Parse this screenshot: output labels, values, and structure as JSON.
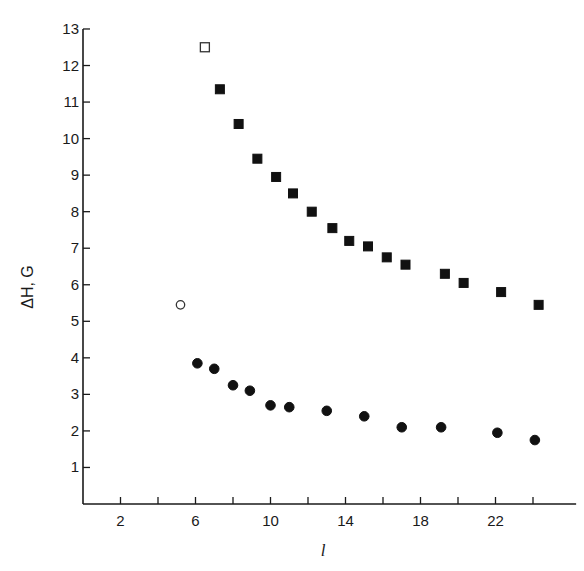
{
  "chart_data": {
    "type": "scatter",
    "title": "",
    "xlabel": "l",
    "ylabel": "ΔH, G",
    "xlim": [
      0,
      26
    ],
    "ylim": [
      0,
      13
    ],
    "grid": false,
    "legend": "none",
    "x_ticks": [
      2,
      4,
      6,
      8,
      10,
      12,
      14,
      16,
      18,
      20,
      22,
      24
    ],
    "x_tick_labels": [
      {
        "value": 2,
        "label": "2"
      },
      {
        "value": 6,
        "label": "6"
      },
      {
        "value": 10,
        "label": "10"
      },
      {
        "value": 14,
        "label": "14"
      },
      {
        "value": 18,
        "label": "18"
      },
      {
        "value": 22,
        "label": "22"
      }
    ],
    "y_ticks": [
      1,
      2,
      3,
      4,
      5,
      6,
      7,
      8,
      9,
      10,
      11,
      12,
      13
    ],
    "y_tick_labels": [
      "1",
      "2",
      "3",
      "4",
      "5",
      "6",
      "7",
      "8",
      "9",
      "10",
      "11",
      "12",
      "13"
    ],
    "series": [
      {
        "name": "squares-filled",
        "marker": "square",
        "filled": true,
        "points": [
          {
            "x": 7.3,
            "y": 11.35
          },
          {
            "x": 8.3,
            "y": 10.4
          },
          {
            "x": 9.3,
            "y": 9.45
          },
          {
            "x": 10.3,
            "y": 8.95
          },
          {
            "x": 11.2,
            "y": 8.5
          },
          {
            "x": 12.2,
            "y": 8.0
          },
          {
            "x": 13.3,
            "y": 7.55
          },
          {
            "x": 14.2,
            "y": 7.2
          },
          {
            "x": 15.2,
            "y": 7.05
          },
          {
            "x": 16.2,
            "y": 6.75
          },
          {
            "x": 17.2,
            "y": 6.55
          },
          {
            "x": 19.3,
            "y": 6.3
          },
          {
            "x": 20.3,
            "y": 6.05
          },
          {
            "x": 22.3,
            "y": 5.8
          },
          {
            "x": 24.3,
            "y": 5.45
          }
        ]
      },
      {
        "name": "square-open",
        "marker": "square",
        "filled": false,
        "points": [
          {
            "x": 6.5,
            "y": 12.5
          }
        ]
      },
      {
        "name": "circles-filled",
        "marker": "circle",
        "filled": true,
        "points": [
          {
            "x": 6.1,
            "y": 3.85
          },
          {
            "x": 7.0,
            "y": 3.7
          },
          {
            "x": 8.0,
            "y": 3.25
          },
          {
            "x": 8.9,
            "y": 3.1
          },
          {
            "x": 10.0,
            "y": 2.7
          },
          {
            "x": 11.0,
            "y": 2.65
          },
          {
            "x": 13.0,
            "y": 2.55
          },
          {
            "x": 15.0,
            "y": 2.4
          },
          {
            "x": 17.0,
            "y": 2.1
          },
          {
            "x": 19.1,
            "y": 2.1
          },
          {
            "x": 22.1,
            "y": 1.95
          },
          {
            "x": 24.1,
            "y": 1.75
          }
        ]
      },
      {
        "name": "circle-open",
        "marker": "circle",
        "filled": false,
        "points": [
          {
            "x": 5.2,
            "y": 5.45
          }
        ]
      }
    ]
  }
}
